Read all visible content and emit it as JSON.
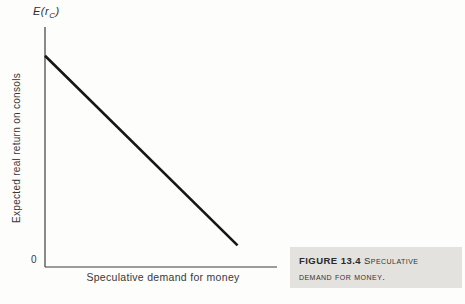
{
  "figure": {
    "y_var": {
      "pre": "E(r",
      "sub": "C",
      "post": ")"
    },
    "origin_label": "0"
  },
  "caption": {
    "label": "FIGURE 13.4",
    "title": "Speculative demand for money."
  },
  "colors": {
    "ink": "#161616",
    "axis": "#3c3c3c",
    "caption_bg": "#e3e2de"
  },
  "chart_data": {
    "type": "line",
    "title": "",
    "xlabel": "Speculative demand for money",
    "ylabel": "Expected real return on consols",
    "y_axis_variable": "E(r_C)",
    "x_tick_labels": [
      "0"
    ],
    "y_tick_labels": [],
    "xlim": [
      0,
      1
    ],
    "ylim": [
      0,
      1
    ],
    "grid": false,
    "legend": "none",
    "series": [
      {
        "name": "speculative-demand-curve",
        "x": [
          0,
          0.83
        ],
        "y": [
          0.88,
          0.09
        ]
      }
    ]
  }
}
